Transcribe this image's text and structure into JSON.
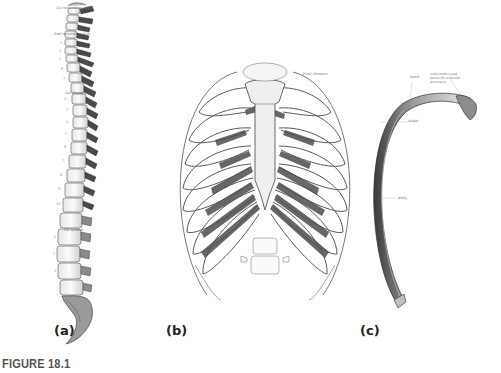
{
  "figure": {
    "caption": "FIGURE 18.1",
    "panels": [
      {
        "id": "a",
        "label": "(a)",
        "subject": "vertebral column (lateral view)",
        "annotations": [
          {
            "text": "1st cervical or Atlas"
          },
          {
            "text": "2nd cervical or Axis"
          },
          {
            "text": "1st thoracic"
          },
          {
            "text": "1st lumbar"
          }
        ]
      },
      {
        "id": "b",
        "label": "(b)",
        "subject": "thoracic cage (anterior view)",
        "annotations": [
          {
            "text": "First thoracic"
          }
        ]
      },
      {
        "id": "c",
        "label": "(c)",
        "subject": "single rib",
        "annotations": [
          {
            "text": "Tuberosities and facets for articular processes"
          },
          {
            "text": "Neck"
          },
          {
            "text": "Angle"
          },
          {
            "text": "Body"
          }
        ]
      }
    ]
  },
  "colors": {
    "background": "#ffffff",
    "ink": "#3a3a3a",
    "shade": "#5a5a5a",
    "bone": "#f4f4f2",
    "caption": "#555555",
    "label": "#222222"
  }
}
